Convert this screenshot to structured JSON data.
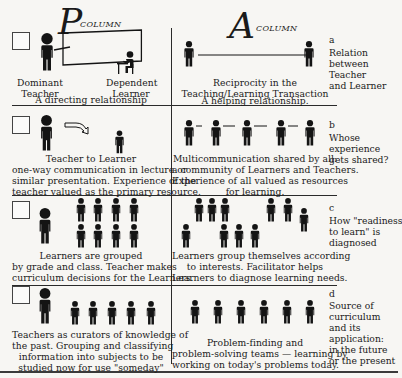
{
  "header": {
    "p_letter": "P",
    "p_label": "COLUMN",
    "a_letter": "A",
    "a_label": "COLUMN"
  },
  "rows": [
    {
      "key": "a",
      "side_label": "Relation between Teacher and Learner",
      "side_lines": [
        "Relation",
        "between",
        "Teacher",
        "and Learner"
      ],
      "p_column": {
        "teacher_label": [
          "Dominant",
          "Teacher"
        ],
        "learner_label": [
          "Dependent",
          "Learner"
        ],
        "caption": "A directing relationship"
      },
      "a_column": {
        "caption_lines": [
          "Reciprocity in the",
          "Teaching/Learning Transaction"
        ],
        "sub_caption": "A helping relationship."
      }
    },
    {
      "key": "b",
      "side_lines": [
        "Whose",
        "experience",
        "gets shared?"
      ],
      "p_column": {
        "caption_lines": [
          "Teacher to Learner",
          "one-way communication in lecture or",
          "similar presentation. Experience of the",
          "teacher valued as the primary resource."
        ]
      },
      "a_column": {
        "caption_lines": [
          "Multicommunication shared by all:",
          "a community of Learners and Teachers.",
          "Experience of all valued as resources",
          "for learning."
        ]
      }
    },
    {
      "key": "c",
      "side_lines": [
        "How \"readiness",
        "to learn\" is",
        "diagnosed"
      ],
      "p_column": {
        "caption_lines": [
          "Learners are grouped",
          "by grade and class. Teacher makes",
          "curriculum decisions for the Learners."
        ]
      },
      "a_column": {
        "caption_lines": [
          "Learners group themselves according",
          "to interests. Facilitator helps",
          "Learners to diagnose learning needs."
        ]
      }
    },
    {
      "key": "d",
      "side_lines": [
        "Source of",
        "curriculum",
        "and its",
        "application:",
        "in the future",
        "or the present"
      ],
      "p_column": {
        "caption_lines": [
          "Teachers as curators of knowledge of",
          "the past. Grouping and classifying",
          "information into subjects to be",
          "studied now for use \"someday\""
        ]
      },
      "a_column": {
        "caption_lines": [
          "Problem-finding and",
          "problem-solving teams — learning by",
          "working on today's problems today."
        ]
      }
    }
  ],
  "colors": {
    "ink": "#1a1a1a",
    "paper": "#f7f6f3",
    "rule": "#2a2a2a"
  }
}
